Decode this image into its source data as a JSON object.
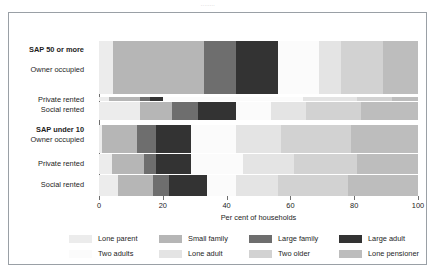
{
  "top_caption": "........",
  "chart_data": {
    "type": "bar",
    "orientation": "horizontal",
    "stacked": true,
    "title": "",
    "xlabel": "Per cent of households",
    "ylabel": "",
    "xlim": [
      0,
      100
    ],
    "xticks": [
      0,
      20,
      40,
      60,
      80,
      100
    ],
    "grid": false,
    "legend_position": "bottom",
    "legend": [
      {
        "name": "Lone parent",
        "color": "#ececec"
      },
      {
        "name": "Small family",
        "color": "#b6b6b6"
      },
      {
        "name": "Large family",
        "color": "#6e6e6e"
      },
      {
        "name": "Large adult",
        "color": "#333333"
      },
      {
        "name": "Two adults",
        "color": "#fbfbfb"
      },
      {
        "name": "Lone adult",
        "color": "#e4e4e4"
      },
      {
        "name": "Two older",
        "color": "#d2d2d2"
      },
      {
        "name": "Lone pensioner",
        "color": "#bdbdbd"
      }
    ],
    "group_labels": [
      "SAP 50 or more",
      "SAP under 10"
    ],
    "categories": [
      {
        "group": "SAP 50 or more",
        "label": "Owner occupied",
        "bold_group_header": true
      },
      {
        "group": "SAP 50 or more",
        "label": "Private rented",
        "bold_group_header": false
      },
      {
        "group": "SAP 50 or more",
        "label": "Social rented",
        "bold_group_header": false
      },
      {
        "group": "SAP under 10",
        "label": "Owner occupied",
        "bold_group_header": true
      },
      {
        "group": "SAP under 10",
        "label": "Private rented",
        "bold_group_header": false
      },
      {
        "group": "SAP under 10",
        "label": "Social rented",
        "bold_group_header": false
      }
    ],
    "series": [
      {
        "name": "Lone parent",
        "values": [
          4.5,
          3.0,
          13.0,
          1.0,
          4.0,
          6.0
        ]
      },
      {
        "name": "Small family",
        "values": [
          28.5,
          10.0,
          10.0,
          11.0,
          10.0,
          11.0
        ]
      },
      {
        "name": "Large family",
        "values": [
          10.0,
          3.0,
          8.0,
          6.0,
          4.0,
          5.0
        ]
      },
      {
        "name": "Large adult",
        "values": [
          13.0,
          4.0,
          12.0,
          11.0,
          11.0,
          12.0
        ]
      },
      {
        "name": "Two adults",
        "values": [
          13.0,
          44.0,
          11.0,
          14.0,
          16.0,
          9.0
        ]
      },
      {
        "name": "Lone adult",
        "values": [
          7.0,
          17.0,
          11.0,
          14.0,
          16.0,
          13.0
        ]
      },
      {
        "name": "Two older",
        "values": [
          13.0,
          11.0,
          17.0,
          22.0,
          20.0,
          22.0
        ]
      },
      {
        "name": "Lone pensioner",
        "values": [
          11.0,
          8.0,
          18.0,
          21.0,
          19.0,
          22.0
        ]
      }
    ]
  }
}
